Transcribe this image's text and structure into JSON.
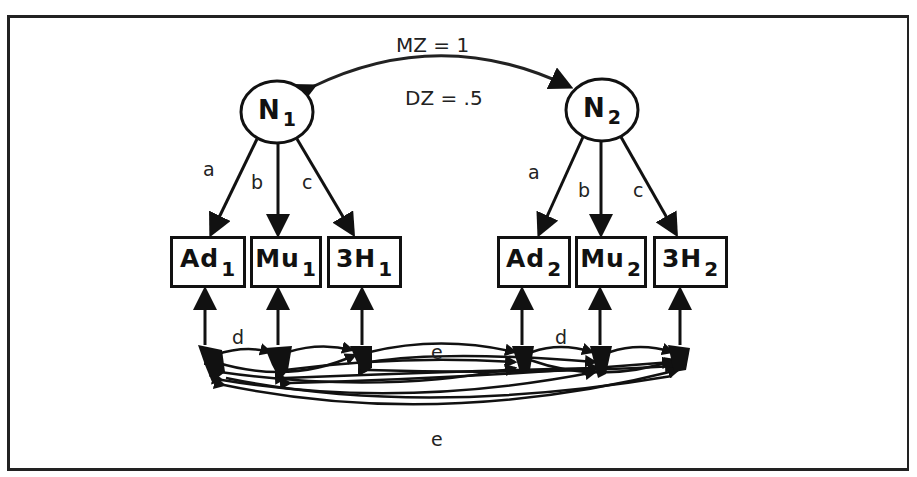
{
  "twin_correlation": {
    "mz_label": "MZ = 1",
    "dz_label": "DZ = .5"
  },
  "latent_factors": [
    {
      "id": "N1",
      "name": "N",
      "sub": "1"
    },
    {
      "id": "N2",
      "name": "N",
      "sub": "2"
    }
  ],
  "loadings": {
    "a": "a",
    "b": "b",
    "c": "c"
  },
  "observed": {
    "twin1": [
      {
        "name": "Ad",
        "sub": "1"
      },
      {
        "name": "Mu",
        "sub": "1"
      },
      {
        "name": "3H",
        "sub": "1"
      }
    ],
    "twin2": [
      {
        "name": "Ad",
        "sub": "2"
      },
      {
        "name": "Mu",
        "sub": "2"
      },
      {
        "name": "3H",
        "sub": "2"
      }
    ]
  },
  "residual_labels": {
    "within_twin1": "d",
    "within_twin2": "d",
    "cross_twin_upper": "e",
    "cross_twin_lower": "e"
  }
}
